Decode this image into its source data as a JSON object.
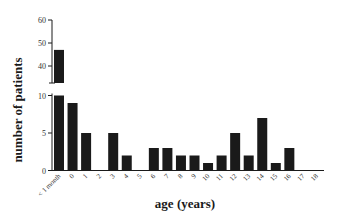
{
  "chart_data": {
    "type": "bar",
    "title": "",
    "xlabel": "age (years)",
    "ylabel": "number of patients",
    "broken_axis": true,
    "y_lower_segment": {
      "range": [
        0,
        10
      ],
      "ticks": [
        0,
        5,
        10
      ]
    },
    "y_upper_segment": {
      "range": [
        30,
        60
      ],
      "ticks": [
        40,
        50,
        60
      ]
    },
    "categories": [
      "< 1 month",
      "0",
      "1",
      "2",
      "3",
      "4",
      "5",
      "6",
      "7",
      "8",
      "9",
      "10",
      "11",
      "12",
      "13",
      "14",
      "15",
      "16",
      "17",
      "18"
    ],
    "values": [
      47,
      9,
      5,
      0,
      5,
      2,
      0,
      3,
      3,
      2,
      2,
      1,
      2,
      5,
      2,
      7,
      1,
      3,
      0,
      0
    ],
    "grid": false,
    "legend": null,
    "bar_color": "#1a1a1a"
  },
  "labels": {
    "xlabel": "age (years)",
    "ylabel": "number of patients"
  }
}
